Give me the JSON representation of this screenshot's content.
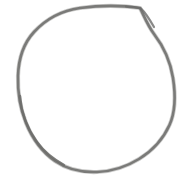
{
  "canvas": {
    "width": 194,
    "height": 188,
    "background_color": "#ffffff",
    "title": "Hand-drawn circle sketch"
  },
  "drawing": {
    "type": "freehand-sketch",
    "subject": "circle",
    "stroke_color": "#7a7a78",
    "stroke_color_light": "#8e8e8c",
    "stroke_color_dark": "#6c6c6a",
    "stroke_width": 2.6,
    "stroke_style": "pencil",
    "closed": true,
    "bounds": {
      "left": 18,
      "right": 175,
      "top": 6,
      "bottom": 172
    },
    "center": {
      "x": 96.5,
      "y": 89
    },
    "radius_x": 78,
    "radius_y": 83,
    "notes": "top arc slightly flattened; small overlap kink near top-right where stroke starts and ends",
    "path_main": "M 140 8 C 120 5 98 5.5 80 8 C 62 10.5 46 19 34 32 C 22.5 44.5 18.5 60 18 76 C 17.5 92 20 108 26 123 C 32.5 139 42 152 55 161 C 68 170 83 172.5 97 172 C 111 171.5 126 167 139 159 C 152 151 163 139.5 169.5 125 C 176 110.5 175.5 94 173 78 C 170.5 62 164 47 154 34 C 148 26 144 16 140 8 Z",
    "path_accent_lower_left": "M 20 96 C 21 112 27 128 37 142 C 44.5 152.5 54 159.5 64 165",
    "path_accent_top_right": "M 126 6.5 C 132 6.6 137 7.2 141 8.6 C 146 13 150 20 154 27"
  }
}
